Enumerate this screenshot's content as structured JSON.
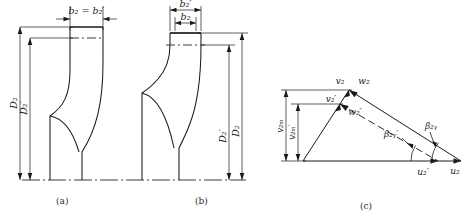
{
  "figure": {
    "panels": [
      {
        "caption": "(a)",
        "description": "Meridional section of impeller with cylindrical outlet trim; outlet width unchanged",
        "labels": {
          "b2_eq": "b₂ = b₂′",
          "D2": "D₂",
          "D2p": "D₂′"
        }
      },
      {
        "caption": "(b)",
        "description": "Meridional section of impeller with oblique outlet trim; outlet width reduced",
        "labels": {
          "b2p": "b₂′",
          "b2": "b₂",
          "D2": "D₂",
          "D2p": "D₂′"
        }
      },
      {
        "caption": "(c)",
        "description": "Outlet velocity triangles before and after impeller trimming",
        "labels": {
          "v2": "v₂",
          "w2": "w₂",
          "v2p": "v₂′",
          "w2p": "w₂′",
          "u2": "u₂",
          "u2p": "u₂′",
          "beta2y": "β₂ᵧ",
          "beta2yp": "β₂ᵧ′",
          "v2m": "v₂ₘ",
          "v2mp": "v₂ₘ′"
        }
      }
    ]
  },
  "colors": {
    "line": "#1a1a1a",
    "thin": "#3a3a3a",
    "background": "#ffffff"
  }
}
